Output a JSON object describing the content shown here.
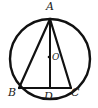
{
  "figure": {
    "type": "geometry-diagram",
    "background_color": "#ffffff",
    "stroke_color": "#111111",
    "label_color": "#1a1a1a",
    "canvas": {
      "width": 98,
      "height": 108
    },
    "labels": {
      "apex": "A",
      "bottom_left": "B",
      "bottom_right": "C",
      "foot_of_altitude": "D",
      "center": "O"
    },
    "circle": {
      "name": "circumcircle",
      "center_x": 50,
      "center_y": 59,
      "radius": 40,
      "stroke_width": 2.4
    },
    "points": {
      "A": {
        "x": 50,
        "y": 19
      },
      "B": {
        "x": 19,
        "y": 88
      },
      "C": {
        "x": 71,
        "y": 88
      },
      "D": {
        "x": 50,
        "y": 88
      },
      "O": {
        "x": 49,
        "y": 57
      }
    },
    "segments": [
      {
        "name": "side-AB",
        "x1": 50,
        "y1": 19,
        "x2": 19,
        "y2": 88,
        "stroke_width": 2.2
      },
      {
        "name": "side-AC",
        "x1": 50,
        "y1": 19,
        "x2": 71,
        "y2": 88,
        "stroke_width": 2.2
      },
      {
        "name": "side-BC",
        "x1": 19,
        "y1": 88,
        "x2": 71,
        "y2": 88,
        "stroke_width": 2.2
      },
      {
        "name": "altitude-AD",
        "x1": 50,
        "y1": 19,
        "x2": 50,
        "y2": 88,
        "stroke_width": 2.0
      }
    ],
    "center_dot": {
      "x": 49,
      "y": 57,
      "radius": 1.3
    }
  }
}
